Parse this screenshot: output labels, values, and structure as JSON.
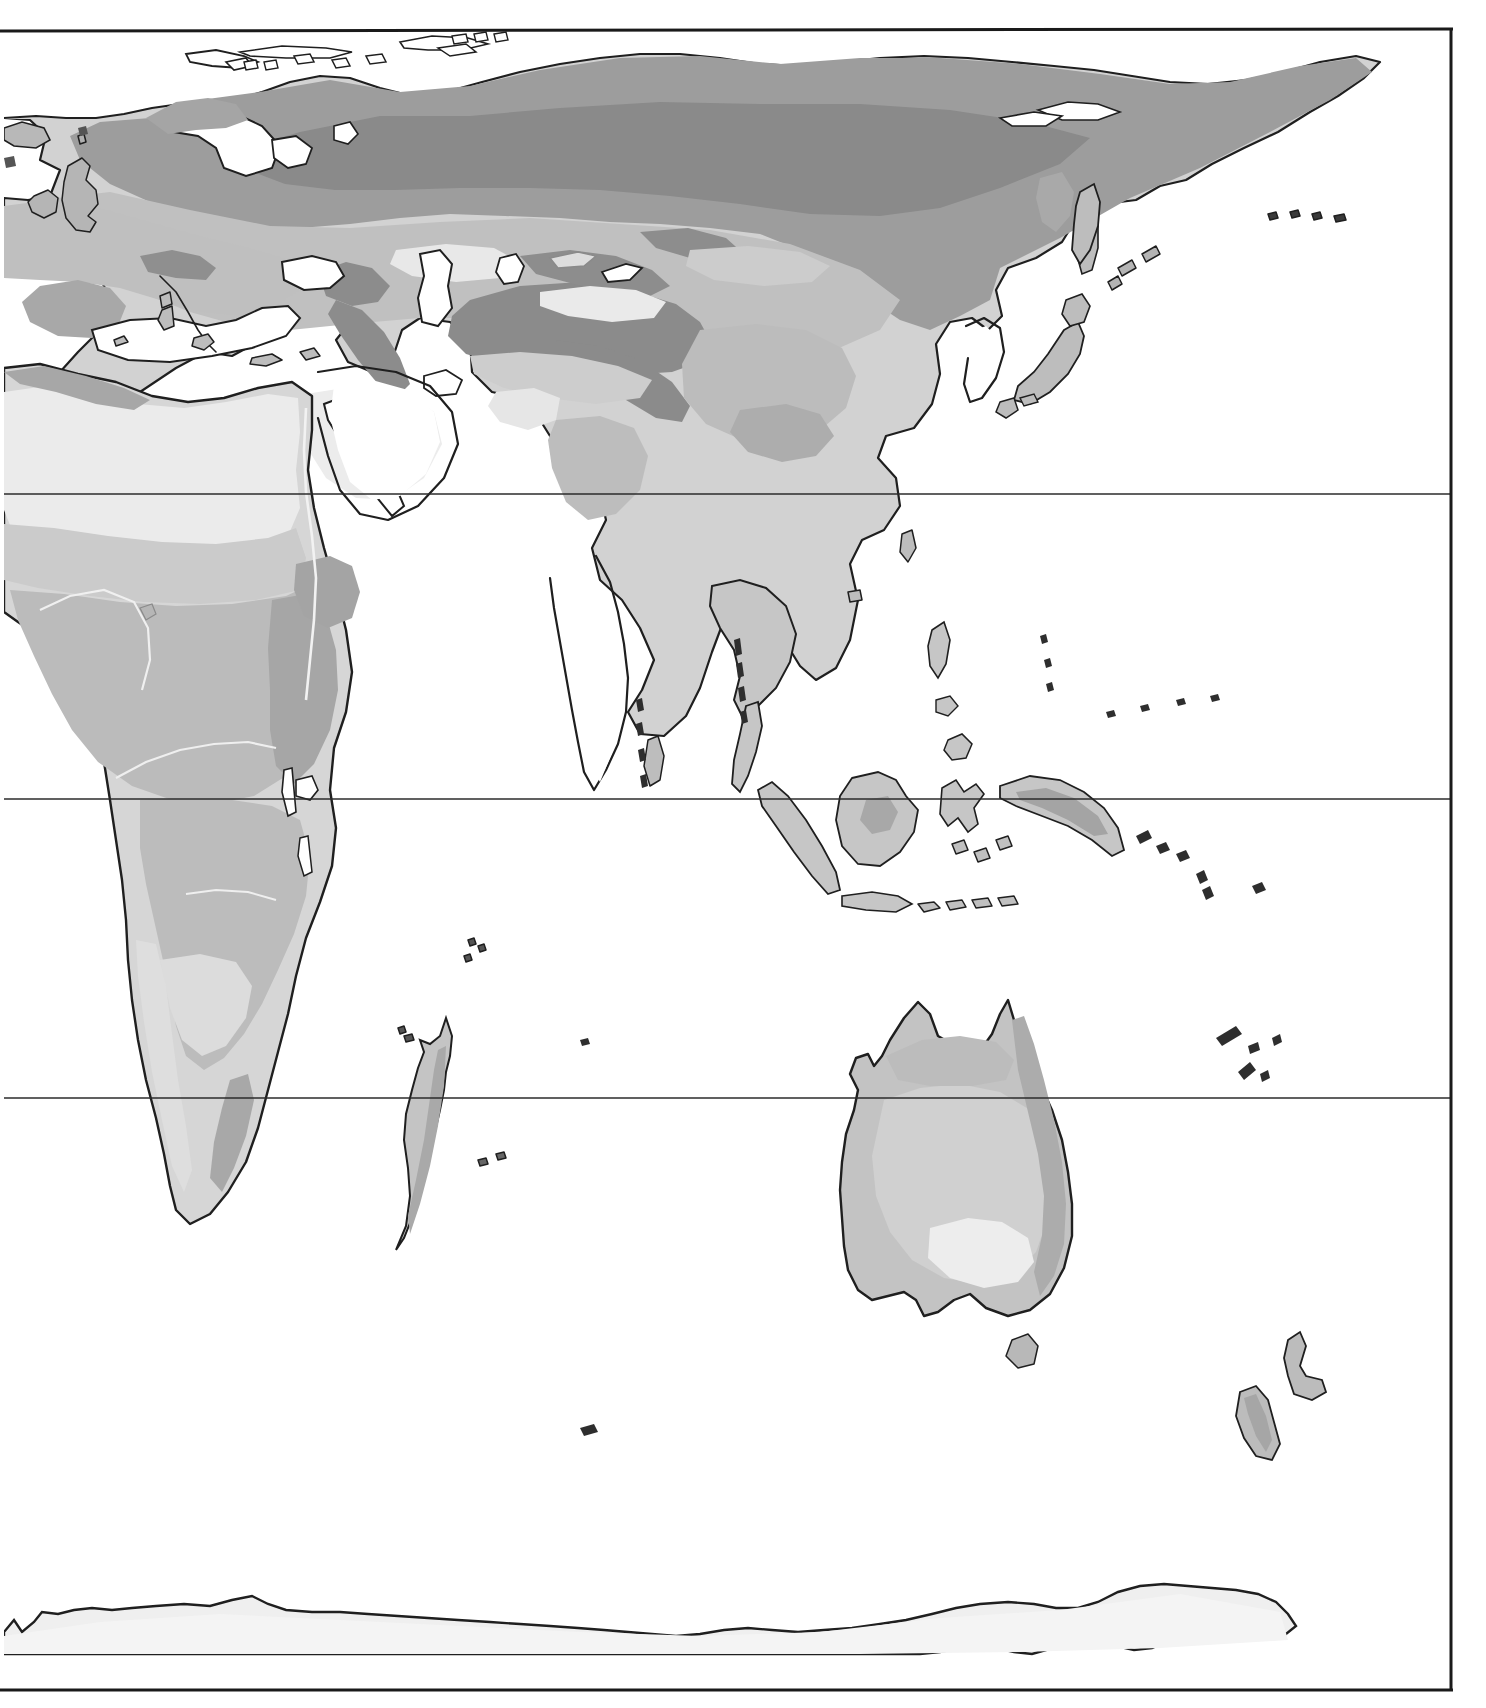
{
  "map": {
    "title": "Eastern Hemisphere Physical Shaded Map",
    "projection": "equirectangular",
    "canvas": {
      "width": 1486,
      "height": 1708
    },
    "neatline": {
      "left": 4,
      "top": 30,
      "right": 1452,
      "bottom": 1690,
      "color": "#1a1a1a",
      "width": 3
    },
    "background_color": "#ffffff",
    "coastline_color": "#1f1f1f",
    "gridlines": [
      {
        "name": "tropic-of-cancer",
        "label": "Tropic of Cancer",
        "latitude_deg": 23.5,
        "y": 494,
        "color": "#2b2b2b"
      },
      {
        "name": "equator",
        "label": "Equator",
        "latitude_deg": 0,
        "y": 799,
        "color": "#2b2b2b"
      },
      {
        "name": "tropic-of-capricorn",
        "label": "Tropic of Capricorn",
        "latitude_deg": -23.5,
        "y": 1098,
        "color": "#2b2b2b"
      }
    ],
    "shade_legend": [
      {
        "key": "tone-1",
        "label": "lowest / lightest",
        "color": "#ededed"
      },
      {
        "key": "tone-2",
        "label": "low",
        "color": "#dedede"
      },
      {
        "key": "tone-3",
        "label": "mid-low",
        "color": "#cfcfcf"
      },
      {
        "key": "tone-4",
        "label": "mid",
        "color": "#bdbdbd"
      },
      {
        "key": "tone-5",
        "label": "mid-high",
        "color": "#a8a8a8"
      },
      {
        "key": "tone-6",
        "label": "high / darkest",
        "color": "#8f8f8f"
      }
    ],
    "landmasses": [
      {
        "name": "eurasia",
        "label": "Eurasia"
      },
      {
        "name": "africa",
        "label": "Africa"
      },
      {
        "name": "arabia",
        "label": "Arabian Peninsula"
      },
      {
        "name": "india",
        "label": "Indian Subcontinent"
      },
      {
        "name": "indochina",
        "label": "Indochina"
      },
      {
        "name": "sumatra",
        "label": "Sumatra"
      },
      {
        "name": "java",
        "label": "Java"
      },
      {
        "name": "borneo",
        "label": "Borneo"
      },
      {
        "name": "sulawesi",
        "label": "Sulawesi"
      },
      {
        "name": "new-guinea",
        "label": "New Guinea"
      },
      {
        "name": "philippines",
        "label": "Philippines"
      },
      {
        "name": "japan",
        "label": "Japan"
      },
      {
        "name": "korea",
        "label": "Korean Peninsula"
      },
      {
        "name": "kamchatka",
        "label": "Kamchatka"
      },
      {
        "name": "sakhalin",
        "label": "Sakhalin"
      },
      {
        "name": "taiwan",
        "label": "Taiwan"
      },
      {
        "name": "sri-lanka",
        "label": "Sri Lanka"
      },
      {
        "name": "madagascar",
        "label": "Madagascar"
      },
      {
        "name": "australia",
        "label": "Australia"
      },
      {
        "name": "tasmania",
        "label": "Tasmania"
      },
      {
        "name": "new-zealand",
        "label": "New Zealand"
      },
      {
        "name": "british-isles",
        "label": "British Isles"
      },
      {
        "name": "iceland",
        "label": "Iceland"
      },
      {
        "name": "scandinavia",
        "label": "Scandinavia"
      },
      {
        "name": "iberia",
        "label": "Iberian Peninsula"
      },
      {
        "name": "italy",
        "label": "Italian Peninsula"
      },
      {
        "name": "svalbard",
        "label": "Svalbard"
      },
      {
        "name": "novaya-zemlya",
        "label": "Novaya Zemlya"
      },
      {
        "name": "new-siberian-islands",
        "label": "New Siberian Islands"
      },
      {
        "name": "antarctica",
        "label": "Antarctica"
      }
    ],
    "water_bodies": [
      {
        "name": "mediterranean-sea",
        "label": "Mediterranean Sea"
      },
      {
        "name": "black-sea",
        "label": "Black Sea"
      },
      {
        "name": "caspian-sea",
        "label": "Caspian Sea"
      },
      {
        "name": "aral-sea",
        "label": "Aral Sea"
      },
      {
        "name": "red-sea",
        "label": "Red Sea"
      },
      {
        "name": "persian-gulf",
        "label": "Persian Gulf"
      },
      {
        "name": "lake-baikal",
        "label": "Lake Baikal"
      },
      {
        "name": "lake-balkhash",
        "label": "Lake Balkhash"
      },
      {
        "name": "lake-victoria",
        "label": "Lake Victoria"
      },
      {
        "name": "lake-tanganyika",
        "label": "Lake Tanganyika"
      },
      {
        "name": "indian-ocean",
        "label": "Indian Ocean"
      },
      {
        "name": "pacific-ocean",
        "label": "Pacific Ocean"
      },
      {
        "name": "arctic-ocean",
        "label": "Arctic Ocean"
      }
    ]
  }
}
